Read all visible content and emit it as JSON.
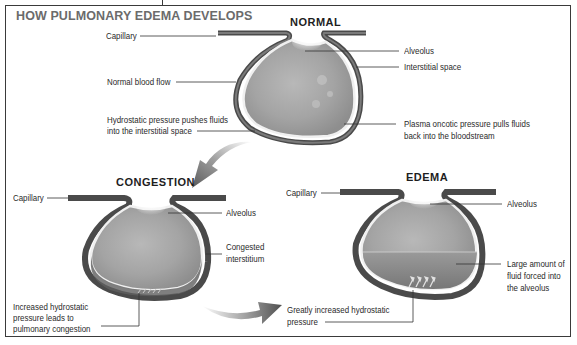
{
  "diagram": {
    "title": "HOW PULMONARY EDEMA DEVELOPS",
    "colors": {
      "frame": "#3a3a3a",
      "title_text": "#6b6b6b",
      "alveolus_fill": "#a9a9a9",
      "capillary_wall": "#4a4a4a",
      "interstitium_light": "#e8e8e8",
      "arrow_gray": "#8c8c8c"
    },
    "panels": {
      "normal": {
        "heading": "NORMAL",
        "labels": {
          "capillary": "Capillary",
          "normal_blood_flow": "Normal blood flow",
          "hydrostatic_line1": "Hydrostatic pressure pushes fluids",
          "hydrostatic_line2": "into the interstitial space",
          "alveolus": "Alveolus",
          "interstitial_space": "Interstitial space",
          "oncotic_line1": "Plasma oncotic pressure pulls fluids",
          "oncotic_line2": "back into the bloodstream"
        }
      },
      "congestion": {
        "heading": "CONGESTION",
        "labels": {
          "capillary": "Capillary",
          "alveolus": "Alveolus",
          "congested_line1": "Congested",
          "congested_line2": "interstitium",
          "increased_line1": "Increased hydrostatic",
          "increased_line2": "pressure leads to",
          "increased_line3": "pulmonary congestion"
        }
      },
      "edema": {
        "heading": "EDEMA",
        "labels": {
          "capillary": "Capillary",
          "alveolus": "Alveolus",
          "fluid_line1": "Large amount of",
          "fluid_line2": "fluid forced into",
          "fluid_line3": "the alveolus",
          "greatly_line1": "Greatly increased hydrostatic",
          "greatly_line2": "pressure"
        }
      }
    },
    "icons": [
      "curved-arrow-down-left",
      "curved-arrow-right",
      "pressure-arrows-up"
    ]
  }
}
